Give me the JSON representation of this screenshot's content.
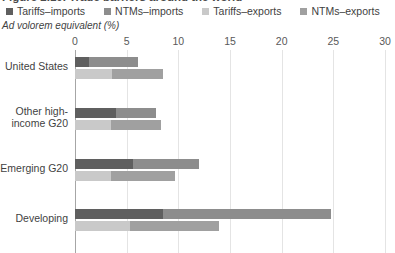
{
  "title": "Figure 2.10. Trade barriers around the world",
  "axis_unit": "Ad volorem equivalent (%)",
  "legend": [
    {
      "label": "Tariffs–imports",
      "color": "#5f5f5f"
    },
    {
      "label": "NTMs–imports",
      "color": "#8d8d8d"
    },
    {
      "label": "Tariffs–exports",
      "color": "#c9c9c9"
    },
    {
      "label": "NTMs–exports",
      "color": "#a0a0a0"
    }
  ],
  "chart_data": {
    "type": "bar",
    "orientation": "horizontal",
    "stacked": true,
    "title": "Figure 2.10. Trade barriers around the world",
    "xlabel": "Ad volorem equivalent (%)",
    "ylabel": "",
    "xlim": [
      0,
      30
    ],
    "xticks": [
      0,
      5,
      10,
      15,
      20,
      25,
      30
    ],
    "xtick_labels": [
      "0",
      "5",
      "10",
      "15",
      "20",
      "25",
      "30"
    ],
    "grid": true,
    "legend_position": "top",
    "categories": [
      "United States",
      "Other high-income G20",
      "Emerging G20",
      "Developing"
    ],
    "series": [
      {
        "name": "Tariffs–imports",
        "color": "#5f5f5f",
        "group": "imports",
        "values": [
          1.4,
          4.0,
          5.6,
          8.5
        ]
      },
      {
        "name": "NTMs–imports",
        "color": "#8d8d8d",
        "group": "imports",
        "values": [
          4.7,
          3.8,
          6.4,
          16.3
        ]
      },
      {
        "name": "Tariffs–exports",
        "color": "#c9c9c9",
        "group": "exports",
        "values": [
          3.6,
          3.5,
          3.5,
          5.3
        ]
      },
      {
        "name": "NTMs–exports",
        "color": "#a0a0a0",
        "group": "exports",
        "values": [
          4.9,
          4.8,
          6.2,
          8.6
        ]
      }
    ],
    "bars": [
      {
        "category": "United States",
        "imports": {
          "tariffs": 1.4,
          "ntms": 4.7,
          "total": 6.1
        },
        "exports": {
          "tariffs": 3.6,
          "ntms": 4.9,
          "total": 8.5
        }
      },
      {
        "category": "Other high-income G20",
        "imports": {
          "tariffs": 4.0,
          "ntms": 3.8,
          "total": 7.8
        },
        "exports": {
          "tariffs": 3.5,
          "ntms": 4.8,
          "total": 8.3
        }
      },
      {
        "category": "Emerging G20",
        "imports": {
          "tariffs": 5.6,
          "ntms": 6.4,
          "total": 12.0
        },
        "exports": {
          "tariffs": 3.5,
          "ntms": 6.2,
          "total": 9.7
        }
      },
      {
        "category": "Developing",
        "imports": {
          "tariffs": 8.5,
          "ntms": 16.3,
          "total": 24.8
        },
        "exports": {
          "tariffs": 5.3,
          "ntms": 8.6,
          "total": 13.9
        }
      }
    ]
  }
}
